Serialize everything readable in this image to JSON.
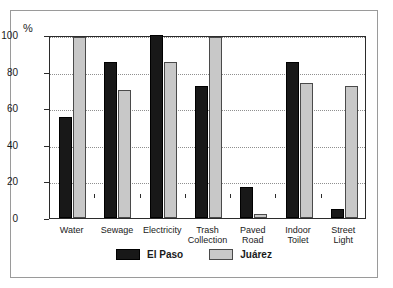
{
  "chart_data": {
    "type": "bar",
    "title": "",
    "xlabel": "",
    "ylabel": "%",
    "ylim": [
      0,
      100
    ],
    "yticks": [
      0,
      20,
      40,
      60,
      80,
      100
    ],
    "grid": true,
    "legend_position": "bottom-center",
    "categories": [
      "Water",
      "Sewage",
      "Electricity",
      "Trash\nCollection",
      "Paved\nRoad",
      "Indoor\nToilet",
      "Street\nLight"
    ],
    "series": [
      {
        "name": "El Paso",
        "color": "#181818",
        "values": [
          55,
          85,
          100,
          72,
          17,
          85,
          5
        ]
      },
      {
        "name": "Juárez",
        "color": "#c8c8c8",
        "values": [
          99,
          70,
          85,
          99,
          2,
          74,
          72
        ]
      }
    ]
  },
  "axis": {
    "unit_label": "%"
  },
  "colors": {
    "el_paso": "#181818",
    "juarez": "#c8c8c8",
    "frame": "#9a9a9a",
    "plot_border": "#2b2b2b",
    "gridline": "#8f8f8f",
    "text": "#1a1a1a"
  }
}
